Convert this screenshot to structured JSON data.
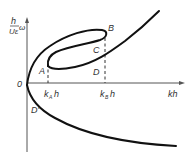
{
  "diagram": {
    "y_axis_label_top": "h",
    "y_axis_label_bottom": "Uε",
    "y_axis_label_omega": "ω",
    "origin_label": "0",
    "x_axis_label": "kh",
    "tick_A": "k",
    "tick_A_sub": "A",
    "tick_A_suffix": "h",
    "tick_B": "k",
    "tick_B_sub": "B",
    "tick_B_suffix": "h",
    "points": {
      "A": "A",
      "B": "B",
      "C": "C",
      "D": "D",
      "D_prime": "D'"
    },
    "colors": {
      "curve": "#111111",
      "axis": "#555555",
      "text": "#333333"
    }
  }
}
